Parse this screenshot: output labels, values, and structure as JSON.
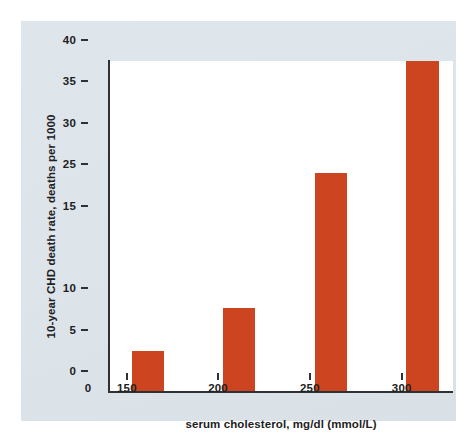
{
  "chart_data": {
    "type": "bar",
    "title": "",
    "subtitle": "",
    "xlabel": "serum cholesterol, mg/dl (mmol/L)",
    "ylabel": "10-year CHD death rate, deaths per 1000",
    "categories": [
      "150",
      "200",
      "250",
      "300"
    ],
    "values": [
      5.0,
      10.2,
      26.5,
      40.0
    ],
    "series": [
      {
        "name": "10-year CHD death rate",
        "values": [
          5.0,
          10.2,
          26.5,
          40.0
        ],
        "color": "#cc4520"
      }
    ],
    "ylim": [
      0,
      40
    ],
    "xlim": [
      0,
      1
    ],
    "grid": false,
    "legend": false,
    "legend_position": "none",
    "y_ticks": [
      {
        "label": "40",
        "value": 40
      },
      {
        "label": "35",
        "value": 35
      },
      {
        "label": "30",
        "value": 30
      },
      {
        "label": "25",
        "value": 25
      },
      {
        "label": "15",
        "value": 20
      },
      {
        "label": "10",
        "value": 10
      },
      {
        "label": "5",
        "value": 5
      },
      {
        "label": "0",
        "value": 0
      }
    ],
    "x_ticks": [
      {
        "label": "0",
        "pos": 0.0
      },
      {
        "label": "150",
        "pos": 0.113
      },
      {
        "label": "200",
        "pos": 0.378
      },
      {
        "label": "250",
        "pos": 0.645
      },
      {
        "label": "300",
        "pos": 0.912
      }
    ],
    "bars": [
      {
        "category": "150",
        "value": 5.0,
        "center": 0.113,
        "width_frac": 0.095
      },
      {
        "category": "200",
        "value": 10.2,
        "center": 0.378,
        "width_frac": 0.095
      },
      {
        "category": "250",
        "value": 26.5,
        "center": 0.645,
        "width_frac": 0.095
      },
      {
        "category": "300",
        "value": 40.0,
        "center": 0.912,
        "width_frac": 0.095
      }
    ]
  },
  "figure": {
    "panel_color": "#dce3e9",
    "plot_background": "#ffffff",
    "axis_color": "#2f3234",
    "bar_color": "#cc4520",
    "text_color": "#1d2123"
  }
}
